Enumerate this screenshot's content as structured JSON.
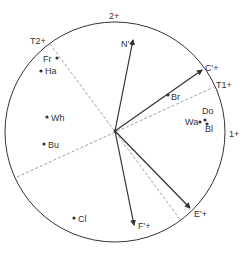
{
  "diagram": {
    "type": "biplot-circle",
    "colors": {
      "stroke": "#333333",
      "dashed": "#888888",
      "text": "#333333"
    },
    "circle": {
      "cx": 115,
      "cy": 132,
      "r": 110
    },
    "origin": {
      "x": 115,
      "y": 131
    },
    "axis_labels": [
      {
        "id": "axis-1",
        "text": "1+",
        "x": 229,
        "y": 137
      },
      {
        "id": "axis-2",
        "text": "2+",
        "x": 109,
        "y": 19
      },
      {
        "id": "axis-t1",
        "text": "T1+",
        "x": 216,
        "y": 88
      },
      {
        "id": "axis-t2",
        "text": "T2+",
        "x": 30,
        "y": 44
      }
    ],
    "vectors": [
      {
        "id": "n",
        "label": "N'+",
        "tip": {
          "x": 133,
          "y": 40
        },
        "label_pos": {
          "x": 121,
          "y": 47
        }
      },
      {
        "id": "c",
        "label": "C'+",
        "tip": {
          "x": 202,
          "y": 70
        },
        "label_pos": {
          "x": 205,
          "y": 71
        }
      },
      {
        "id": "e",
        "label": "E'+",
        "tip": {
          "x": 190,
          "y": 208
        },
        "label_pos": {
          "x": 194,
          "y": 217
        }
      },
      {
        "id": "f",
        "label": "F'+",
        "tip": {
          "x": 134,
          "y": 225
        },
        "label_pos": {
          "x": 138,
          "y": 229
        }
      }
    ],
    "dashed_lines": [
      {
        "id": "t1-axis",
        "x1": 17,
        "y1": 177,
        "x2": 214,
        "y2": 87
      },
      {
        "id": "t2-axis",
        "x1": 50,
        "y1": 44,
        "x2": 182,
        "y2": 222
      }
    ],
    "points": [
      {
        "id": "fr",
        "label": "Fr",
        "x": 57,
        "y": 58,
        "label_pos": {
          "x": 43,
          "y": 62
        }
      },
      {
        "id": "ha",
        "label": "Ha",
        "x": 41,
        "y": 71,
        "label_pos": {
          "x": 45,
          "y": 74
        }
      },
      {
        "id": "wh",
        "label": "Wh",
        "x": 47,
        "y": 117,
        "label_pos": {
          "x": 51,
          "y": 121
        }
      },
      {
        "id": "bu",
        "label": "Bu",
        "x": 44,
        "y": 144,
        "label_pos": {
          "x": 48,
          "y": 148
        }
      },
      {
        "id": "cl",
        "label": "Cl",
        "x": 74,
        "y": 218,
        "label_pos": {
          "x": 78,
          "y": 222
        }
      },
      {
        "id": "br",
        "label": "Br",
        "x": 168,
        "y": 95,
        "label_pos": {
          "x": 171,
          "y": 100
        }
      },
      {
        "id": "do",
        "label": "Do",
        "x": 205,
        "y": 120,
        "label_pos": {
          "x": 202,
          "y": 114
        }
      },
      {
        "id": "wa",
        "label": "Wa",
        "x": 200,
        "y": 122,
        "label_pos": {
          "x": 185,
          "y": 125
        }
      },
      {
        "id": "bl",
        "label": "Bl",
        "x": 207,
        "y": 124,
        "label_pos": {
          "x": 205,
          "y": 132
        }
      }
    ]
  }
}
